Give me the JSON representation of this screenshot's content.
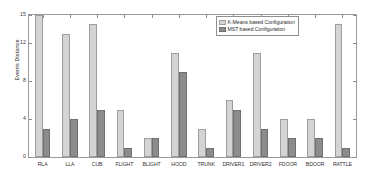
{
  "chart_data": {
    "type": "bar",
    "title": "",
    "xlabel": "",
    "ylabel": "Events Distance",
    "categories": [
      "RLA",
      "LLA",
      "CUB",
      "FLIGHT",
      "BLIGHT",
      "HOOD",
      "TRUNK",
      "DRIVER1",
      "DRIVER2",
      "FDOOR",
      "BDOOR",
      "RATTLE"
    ],
    "series": [
      {
        "name": "K-Means based Configuration",
        "color": "#d4d4d4",
        "values": [
          15,
          13,
          14,
          5,
          2,
          11,
          3,
          6,
          11,
          4,
          4,
          14
        ]
      },
      {
        "name": "MST based Configuration",
        "color": "#8c8c8c",
        "values": [
          3,
          4,
          5,
          1,
          2,
          9,
          1,
          5,
          3,
          2,
          2,
          1
        ]
      }
    ],
    "ylim": [
      0,
      15
    ],
    "yticks": [
      0,
      4,
      8,
      12,
      15
    ],
    "ytick_labels": [
      "0",
      "4",
      "8",
      "12",
      "15"
    ],
    "grid": false,
    "legend_position": "top-right"
  }
}
